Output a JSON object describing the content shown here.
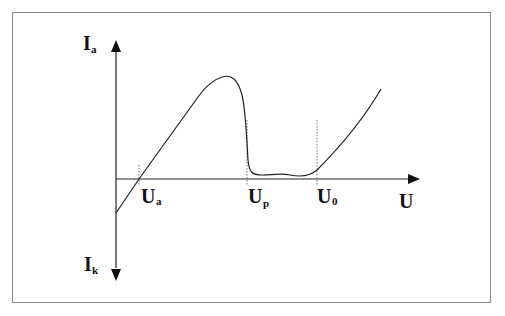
{
  "diagram": {
    "type": "current-voltage characteristic (tunnel / negative-resistance curve)",
    "axes": {
      "y_positive_label": {
        "main": "I",
        "sub": "a"
      },
      "y_negative_label": {
        "main": "I",
        "sub": "k"
      },
      "x_label": "U"
    },
    "markers": [
      {
        "main": "U",
        "sub": "a"
      },
      {
        "main": "U",
        "sub": "p"
      },
      {
        "main": "U",
        "sub": "0"
      }
    ],
    "colors": {
      "line": "#222222",
      "frame": "#8a8a8a",
      "background": "#ffffff"
    }
  }
}
